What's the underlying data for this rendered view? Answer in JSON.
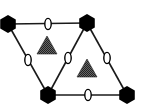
{
  "diagram": {
    "type": "lattice",
    "colors": {
      "edge": "#1a1a1a",
      "hexagon": "#000000",
      "oval_fill": "#ffffff",
      "oval_stroke": "#000000",
      "triangle": "#555555"
    },
    "nodes": [
      {
        "id": "tl",
        "shape": "hexagon",
        "x": 8,
        "y": 24
      },
      {
        "id": "tr",
        "shape": "hexagon",
        "x": 87,
        "y": 23
      },
      {
        "id": "bl",
        "shape": "hexagon",
        "x": 48,
        "y": 95
      },
      {
        "id": "br",
        "shape": "hexagon",
        "x": 127,
        "y": 95
      }
    ],
    "edges": [
      {
        "from": "tl",
        "to": "tr",
        "marker": "oval",
        "mx": 48,
        "my": 24
      },
      {
        "from": "tl",
        "to": "bl",
        "marker": "oval",
        "mx": 28,
        "my": 60
      },
      {
        "from": "tr",
        "to": "bl",
        "marker": "oval",
        "mx": 68,
        "my": 58
      },
      {
        "from": "tr",
        "to": "br",
        "marker": "oval",
        "mx": 107,
        "my": 58
      },
      {
        "from": "bl",
        "to": "br",
        "marker": "oval",
        "mx": 88,
        "my": 95
      }
    ],
    "faces": [
      {
        "id": "face-left",
        "shape": "triangle",
        "x": 47,
        "y": 45
      },
      {
        "id": "face-right",
        "shape": "triangle",
        "x": 87,
        "y": 68
      }
    ]
  }
}
